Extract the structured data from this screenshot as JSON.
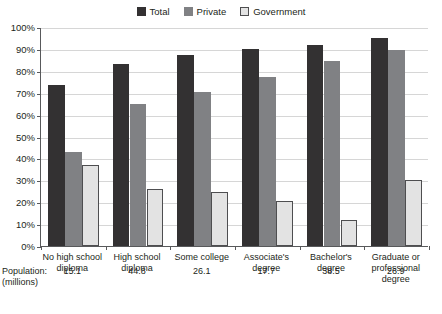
{
  "chart_data": {
    "type": "bar",
    "title": "",
    "xlabel": "",
    "ylabel": "",
    "ylim": [
      0,
      100
    ],
    "ytick_labels": [
      "100%",
      "90%",
      "80%",
      "70%",
      "60%",
      "50%",
      "40%",
      "30%",
      "20%",
      "10%",
      "0%"
    ],
    "ytick_values": [
      100,
      90,
      80,
      70,
      60,
      50,
      40,
      30,
      20,
      10,
      0
    ],
    "grid": true,
    "legend_position": "top-center",
    "categories": [
      "No high school diploma",
      "High school diploma",
      "Some college",
      "Associate's degree",
      "Bachelor's degree",
      "Graduate or professional degree"
    ],
    "category_lines": [
      [
        "No high school",
        "diploma"
      ],
      [
        "High school",
        "diploma"
      ],
      [
        "Some college"
      ],
      [
        "Associate's",
        "degree"
      ],
      [
        "Bachelor's",
        "degree"
      ],
      [
        "Graduate or",
        "professional degree"
      ]
    ],
    "series": [
      {
        "name": "Total",
        "color": "#333132",
        "values": [
          73.5,
          83.0,
          87.0,
          90.0,
          92.0,
          95.0
        ]
      },
      {
        "name": "Private",
        "color": "#808184",
        "values": [
          43.0,
          65.0,
          70.5,
          77.0,
          84.5,
          89.5
        ]
      },
      {
        "name": "Government",
        "color": "#e3e3e3",
        "values": [
          37.0,
          26.0,
          24.5,
          20.5,
          12.0,
          30.0
        ]
      }
    ],
    "population_label_line1": "Population:",
    "population_label_line2": "(millions)",
    "population_values": [
      "15.1",
      "44.8",
      "26.1",
      "17.7",
      "38.5",
      "26.9"
    ]
  }
}
